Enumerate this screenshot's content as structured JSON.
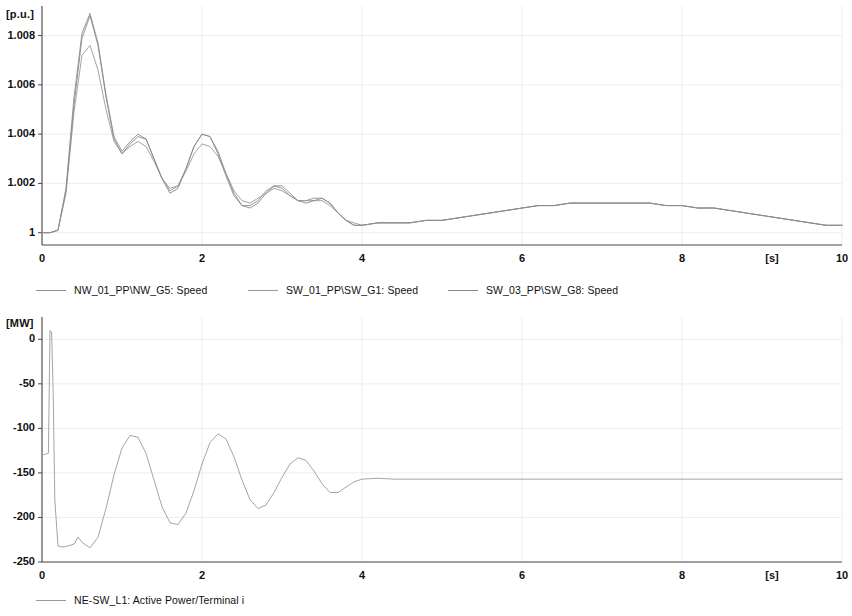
{
  "page": {
    "background_color": "#ffffff",
    "axis_color": "#4a4a4a",
    "grid_color": "#e8e8ef",
    "text_color": "#111111"
  },
  "panels": [
    {
      "id": "speed",
      "unit_label": "[p.u.]",
      "x_unit_label": "[s]",
      "legend": [
        {
          "label": "NW_01_PP\\NW_G5: Speed",
          "color": "#8f8f8f"
        },
        {
          "label": "SW_01_PP\\SW_G1: Speed",
          "color": "#9a9a9a"
        },
        {
          "label": "SW_03_PP\\SW_G8: Speed",
          "color": "#8a8a8a"
        }
      ]
    },
    {
      "id": "power",
      "unit_label": "[MW]",
      "x_unit_label": "[s]",
      "legend": [
        {
          "label": "NE-SW_L1: Active Power/Terminal i",
          "color": "#9a9a9a"
        }
      ]
    }
  ],
  "chart_data": [
    {
      "type": "line",
      "id": "speed-chart",
      "title": "",
      "xlabel": "[s]",
      "ylabel": "[p.u.]",
      "xlim": [
        0,
        10
      ],
      "ylim": [
        0.9995,
        1.0092
      ],
      "xticks": [
        0,
        2,
        4,
        6,
        8,
        10
      ],
      "xticklabels": [
        "0",
        "2",
        "4",
        "6",
        "8",
        "10"
      ],
      "yticks": [
        1,
        1.002,
        1.004,
        1.006,
        1.008
      ],
      "yticklabels": [
        "1",
        "1.002",
        "1.004",
        "1.006",
        "1.008"
      ],
      "grid": true,
      "legend_position": "below",
      "series": [
        {
          "name": "NW_01_PP\\NW_G5: Speed",
          "color": "#8f8f8f",
          "x": [
            0,
            0.1,
            0.2,
            0.3,
            0.4,
            0.5,
            0.6,
            0.7,
            0.8,
            0.9,
            1.0,
            1.1,
            1.2,
            1.3,
            1.4,
            1.5,
            1.6,
            1.7,
            1.8,
            1.9,
            2.0,
            2.1,
            2.2,
            2.3,
            2.4,
            2.5,
            2.6,
            2.7,
            2.8,
            2.9,
            3.0,
            3.1,
            3.2,
            3.3,
            3.4,
            3.5,
            3.6,
            3.7,
            3.8,
            3.9,
            4.0,
            4.2,
            4.4,
            4.6,
            4.8,
            5.0,
            5.2,
            5.4,
            5.6,
            5.8,
            6.0,
            6.2,
            6.4,
            6.6,
            6.8,
            7.0,
            7.2,
            7.4,
            7.6,
            7.8,
            8.0,
            8.2,
            8.4,
            8.6,
            8.8,
            9.0,
            9.2,
            9.4,
            9.6,
            9.8,
            10.0
          ],
          "y": [
            1.0,
            1.0,
            1.0001,
            1.0018,
            1.0055,
            1.0081,
            1.0089,
            1.0077,
            1.0056,
            1.0039,
            1.0033,
            1.0037,
            1.004,
            1.0038,
            1.003,
            1.0022,
            1.0017,
            1.0019,
            1.0026,
            1.0035,
            1.004,
            1.0039,
            1.0033,
            1.0024,
            1.0016,
            1.0011,
            1.0011,
            1.0013,
            1.0017,
            1.0019,
            1.0018,
            1.0015,
            1.0013,
            1.0013,
            1.0014,
            1.0014,
            1.0012,
            1.0008,
            1.0005,
            1.0003,
            1.0003,
            1.0004,
            1.0004,
            1.0004,
            1.0005,
            1.0005,
            1.0006,
            1.0007,
            1.0008,
            1.0009,
            1.001,
            1.0011,
            1.0011,
            1.0012,
            1.0012,
            1.0012,
            1.0012,
            1.0012,
            1.0012,
            1.0011,
            1.0011,
            1.001,
            1.001,
            1.0009,
            1.0008,
            1.0007,
            1.0006,
            1.0005,
            1.0004,
            1.0003,
            1.0003
          ]
        },
        {
          "name": "SW_01_PP\\SW_G1: Speed",
          "color": "#9a9a9a",
          "x": [
            0,
            0.1,
            0.2,
            0.3,
            0.4,
            0.5,
            0.6,
            0.7,
            0.8,
            0.9,
            1.0,
            1.1,
            1.2,
            1.3,
            1.4,
            1.5,
            1.6,
            1.7,
            1.8,
            1.9,
            2.0,
            2.1,
            2.2,
            2.3,
            2.4,
            2.5,
            2.6,
            2.7,
            2.8,
            2.9,
            3.0,
            3.1,
            3.2,
            3.3,
            3.4,
            3.5,
            3.6,
            3.7,
            3.8,
            3.9,
            4.0,
            4.2,
            4.4,
            4.6,
            4.8,
            5.0,
            5.2,
            5.4,
            5.6,
            5.8,
            6.0,
            6.2,
            6.4,
            6.6,
            6.8,
            7.0,
            7.2,
            7.4,
            7.6,
            7.8,
            8.0,
            8.2,
            8.4,
            8.6,
            8.8,
            9.0,
            9.2,
            9.4,
            9.6,
            9.8,
            10.0
          ],
          "y": [
            1.0,
            1.0,
            1.0001,
            1.0016,
            1.0049,
            1.0072,
            1.0076,
            1.0066,
            1.005,
            1.0037,
            1.0032,
            1.0035,
            1.0037,
            1.0035,
            1.0029,
            1.0022,
            1.0018,
            1.0019,
            1.0025,
            1.0032,
            1.0036,
            1.0035,
            1.0031,
            1.0024,
            1.0017,
            1.0013,
            1.0012,
            1.0014,
            1.0016,
            1.0018,
            1.0017,
            1.0015,
            1.0013,
            1.0013,
            1.0013,
            1.0013,
            1.0011,
            1.0008,
            1.0005,
            1.0004,
            1.0003,
            1.0004,
            1.0004,
            1.0004,
            1.0005,
            1.0005,
            1.0006,
            1.0007,
            1.0008,
            1.0009,
            1.001,
            1.0011,
            1.0011,
            1.0012,
            1.0012,
            1.0012,
            1.0012,
            1.0012,
            1.0012,
            1.0011,
            1.0011,
            1.001,
            1.001,
            1.0009,
            1.0008,
            1.0007,
            1.0006,
            1.0005,
            1.0004,
            1.0003,
            1.0003
          ]
        },
        {
          "name": "SW_03_PP\\SW_G8: Speed",
          "color": "#8a8a8a",
          "x": [
            0,
            0.1,
            0.2,
            0.3,
            0.4,
            0.5,
            0.6,
            0.7,
            0.8,
            0.9,
            1.0,
            1.1,
            1.2,
            1.3,
            1.4,
            1.5,
            1.6,
            1.7,
            1.8,
            1.9,
            2.0,
            2.1,
            2.2,
            2.3,
            2.4,
            2.5,
            2.6,
            2.7,
            2.8,
            2.9,
            3.0,
            3.1,
            3.2,
            3.3,
            3.4,
            3.5,
            3.6,
            3.7,
            3.8,
            3.9,
            4.0,
            4.2,
            4.4,
            4.6,
            4.8,
            5.0,
            5.2,
            5.4,
            5.6,
            5.8,
            6.0,
            6.2,
            6.4,
            6.6,
            6.8,
            7.0,
            7.2,
            7.4,
            7.6,
            7.8,
            8.0,
            8.2,
            8.4,
            8.6,
            8.8,
            9.0,
            9.2,
            9.4,
            9.6,
            9.8,
            10.0
          ],
          "y": [
            1.0,
            1.0,
            1.0001,
            1.0017,
            1.0052,
            1.0079,
            1.0088,
            1.0076,
            1.0055,
            1.0038,
            1.0032,
            1.0036,
            1.0039,
            1.0038,
            1.003,
            1.0022,
            1.0016,
            1.0018,
            1.0026,
            1.0035,
            1.004,
            1.0039,
            1.0032,
            1.0023,
            1.0015,
            1.0011,
            1.001,
            1.0012,
            1.0016,
            1.0019,
            1.0019,
            1.0016,
            1.0013,
            1.0012,
            1.0013,
            1.0014,
            1.0012,
            1.0008,
            1.0005,
            1.0003,
            1.0003,
            1.0004,
            1.0004,
            1.0004,
            1.0005,
            1.0005,
            1.0006,
            1.0007,
            1.0008,
            1.0009,
            1.001,
            1.0011,
            1.0011,
            1.0012,
            1.0012,
            1.0012,
            1.0012,
            1.0012,
            1.0012,
            1.0011,
            1.0011,
            1.001,
            1.001,
            1.0009,
            1.0008,
            1.0007,
            1.0006,
            1.0005,
            1.0004,
            1.0003,
            1.0003
          ]
        }
      ]
    },
    {
      "type": "line",
      "id": "power-chart",
      "title": "",
      "xlabel": "[s]",
      "ylabel": "[MW]",
      "xlim": [
        0,
        10
      ],
      "ylim": [
        -250,
        25
      ],
      "xticks": [
        0,
        2,
        4,
        6,
        8,
        10
      ],
      "xticklabels": [
        "0",
        "2",
        "4",
        "6",
        "8",
        "10"
      ],
      "yticks": [
        0,
        -50,
        -100,
        -150,
        -200,
        -250
      ],
      "yticklabels": [
        "0",
        "-50",
        "-100",
        "-150",
        "-200",
        "-250"
      ],
      "grid": true,
      "legend_position": "below",
      "series": [
        {
          "name": "NE-SW_L1: Active Power/Terminal i",
          "color": "#9a9a9a",
          "x": [
            0,
            0.04,
            0.08,
            0.1,
            0.12,
            0.14,
            0.16,
            0.2,
            0.24,
            0.28,
            0.32,
            0.36,
            0.4,
            0.45,
            0.5,
            0.6,
            0.7,
            0.8,
            0.9,
            1.0,
            1.1,
            1.2,
            1.3,
            1.4,
            1.5,
            1.6,
            1.7,
            1.8,
            1.9,
            2.0,
            2.1,
            2.2,
            2.3,
            2.4,
            2.5,
            2.6,
            2.7,
            2.8,
            2.9,
            3.0,
            3.1,
            3.2,
            3.3,
            3.4,
            3.5,
            3.6,
            3.7,
            3.8,
            3.9,
            4.0,
            4.2,
            4.4,
            4.6,
            4.8,
            5.0,
            5.5,
            6.0,
            6.5,
            7.0,
            7.5,
            8.0,
            8.5,
            9.0,
            9.5,
            10.0
          ],
          "y": [
            -130,
            -129,
            -128,
            10,
            8,
            -60,
            -180,
            -232,
            -233,
            -233,
            -232,
            -231,
            -230,
            -222,
            -228,
            -234,
            -222,
            -190,
            -152,
            -122,
            -108,
            -110,
            -128,
            -158,
            -188,
            -206,
            -208,
            -195,
            -170,
            -140,
            -116,
            -106,
            -112,
            -132,
            -158,
            -180,
            -190,
            -186,
            -172,
            -155,
            -140,
            -133,
            -136,
            -148,
            -162,
            -172,
            -172,
            -166,
            -160,
            -157,
            -156,
            -157,
            -157,
            -157,
            -157,
            -157,
            -157,
            -157,
            -157,
            -157,
            -157,
            -157,
            -157,
            -157,
            -157
          ]
        }
      ]
    }
  ]
}
